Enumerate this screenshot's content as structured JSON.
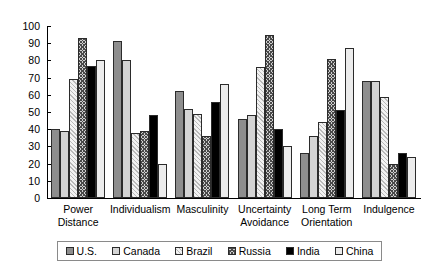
{
  "chart_data": {
    "type": "bar",
    "title": "",
    "xlabel": "",
    "ylabel": "",
    "ylim": [
      0,
      100
    ],
    "ytick_step": 10,
    "yticks": [
      0,
      10,
      20,
      30,
      40,
      50,
      60,
      70,
      80,
      90,
      100
    ],
    "grid": false,
    "legend_position": "bottom",
    "categories": [
      "Power Distance",
      "Individualism",
      "Masculinity",
      "Uncertainty Avoidance",
      "Long Term Orientation",
      "Indulgence"
    ],
    "category_lines": [
      [
        "Power",
        "Distance"
      ],
      [
        "Individualism",
        ""
      ],
      [
        "Masculinity",
        ""
      ],
      [
        "Uncertainty",
        "Avoidance"
      ],
      [
        "Long Term",
        "Orientation"
      ],
      [
        "Indulgence",
        ""
      ]
    ],
    "series": [
      {
        "name": "U.S.",
        "key": "us",
        "fill": "solid-mid-gray",
        "color": "#8e8e8e",
        "values": [
          40,
          91,
          62,
          46,
          26,
          68
        ]
      },
      {
        "name": "Canada",
        "key": "canada",
        "fill": "solid-light-gray",
        "color": "#d4d4d4",
        "values": [
          39,
          80,
          52,
          48,
          36,
          68
        ]
      },
      {
        "name": "Brazil",
        "key": "brazil",
        "fill": "diagonal-hatch",
        "color": "#e8e8e8",
        "values": [
          69,
          38,
          49,
          76,
          44,
          59
        ]
      },
      {
        "name": "Russia",
        "key": "russia",
        "fill": "crosshatch",
        "color": "#cfcfcf",
        "values": [
          93,
          39,
          36,
          95,
          81,
          20
        ]
      },
      {
        "name": "India",
        "key": "india",
        "fill": "solid-black",
        "color": "#000000",
        "values": [
          77,
          48,
          56,
          40,
          51,
          26
        ]
      },
      {
        "name": "China",
        "key": "china",
        "fill": "solid-near-white",
        "color": "#ececec",
        "values": [
          80,
          20,
          66,
          30,
          87,
          24
        ]
      }
    ]
  }
}
